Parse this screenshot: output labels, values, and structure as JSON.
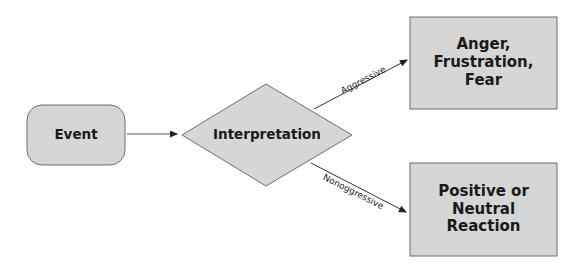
{
  "diagram": {
    "type": "flowchart",
    "colors": {
      "background": "#ffffff",
      "node_fill": "#d6d6d6",
      "node_stroke": "#6e6e6e",
      "edge": "#222222",
      "text": "#1a1a1a"
    },
    "nodes": [
      {
        "id": "event",
        "shape": "rounded-rectangle",
        "label": "Event"
      },
      {
        "id": "interpretation",
        "shape": "diamond",
        "label": "Interpretation"
      },
      {
        "id": "anger",
        "shape": "rectangle",
        "label": "Anger,\nFrustration,\nFear",
        "lines": [
          "Anger,",
          "Frustration,",
          "Fear"
        ]
      },
      {
        "id": "positive",
        "shape": "rectangle",
        "label": "Positive or\nNeutral\nReaction",
        "lines": [
          "Positive or",
          "Neutral",
          "Reaction"
        ]
      }
    ],
    "edges": [
      {
        "from": "event",
        "to": "interpretation",
        "label": ""
      },
      {
        "from": "interpretation",
        "to": "anger",
        "label": "Aggressive"
      },
      {
        "from": "interpretation",
        "to": "positive",
        "label": "Nonoggressive"
      }
    ]
  }
}
